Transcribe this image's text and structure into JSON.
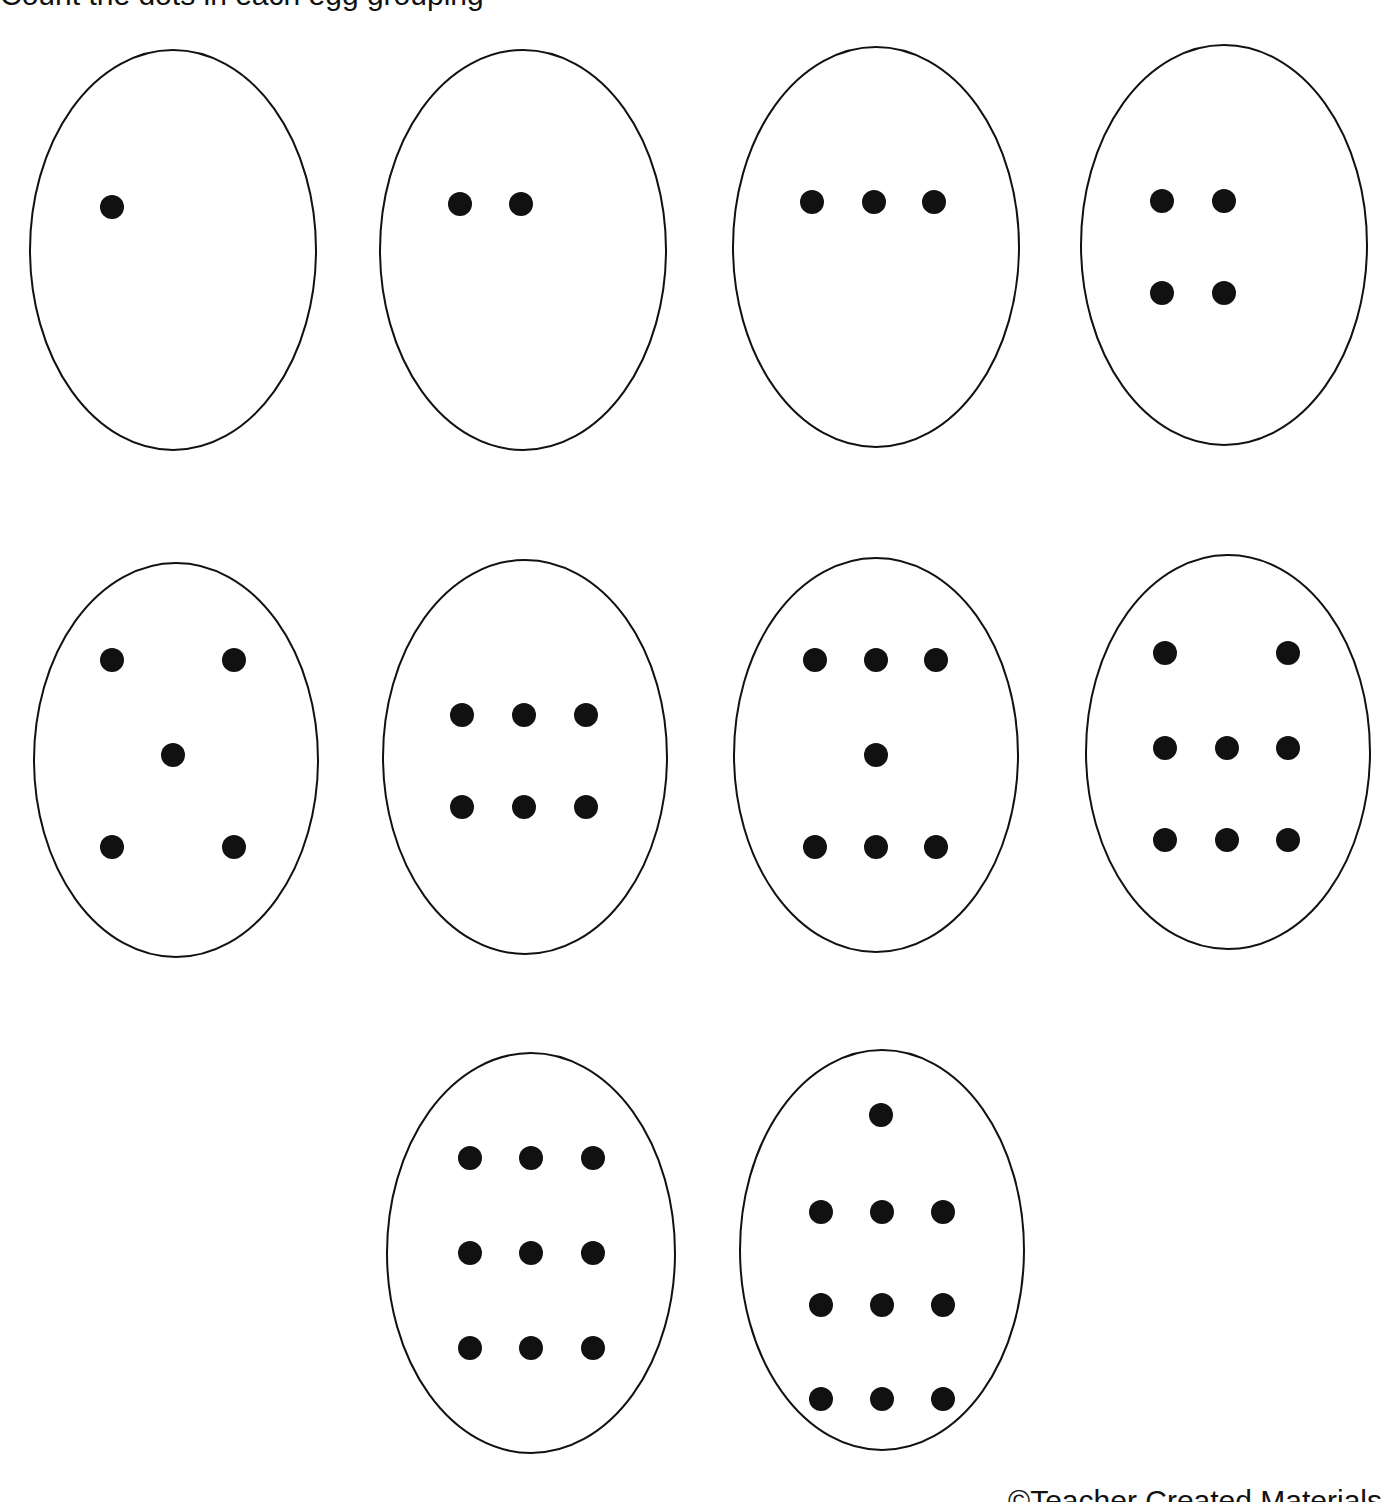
{
  "page": {
    "header_fragment": "Count the dots in each egg grouping",
    "footer_fragment": "©Teacher Created Materials"
  },
  "style": {
    "stroke": "#111111",
    "dot": "#111111",
    "background": "#ffffff"
  },
  "eggs": [
    {
      "count": 1,
      "cx": 173,
      "cy": 250,
      "rx": 143,
      "ry": 200,
      "dots": [
        [
          112,
          207
        ]
      ]
    },
    {
      "count": 2,
      "cx": 523,
      "cy": 250,
      "rx": 143,
      "ry": 200,
      "dots": [
        [
          460,
          204
        ],
        [
          521,
          204
        ]
      ]
    },
    {
      "count": 3,
      "cx": 876,
      "cy": 247,
      "rx": 143,
      "ry": 200,
      "dots": [
        [
          812,
          202
        ],
        [
          874,
          202
        ],
        [
          934,
          202
        ]
      ]
    },
    {
      "count": 4,
      "cx": 1224,
      "cy": 245,
      "rx": 143,
      "ry": 200,
      "dots": [
        [
          1162,
          201
        ],
        [
          1224,
          201
        ],
        [
          1162,
          293
        ],
        [
          1224,
          293
        ]
      ]
    },
    {
      "count": 5,
      "cx": 176,
      "cy": 760,
      "rx": 142,
      "ry": 197,
      "dots": [
        [
          112,
          660
        ],
        [
          234,
          660
        ],
        [
          173,
          755
        ],
        [
          112,
          847
        ],
        [
          234,
          847
        ]
      ]
    },
    {
      "count": 6,
      "cx": 525,
      "cy": 757,
      "rx": 142,
      "ry": 197,
      "dots": [
        [
          462,
          715
        ],
        [
          524,
          715
        ],
        [
          586,
          715
        ],
        [
          462,
          807
        ],
        [
          524,
          807
        ],
        [
          586,
          807
        ]
      ]
    },
    {
      "count": 7,
      "cx": 876,
      "cy": 755,
      "rx": 142,
      "ry": 197,
      "dots": [
        [
          815,
          660
        ],
        [
          876,
          660
        ],
        [
          936,
          660
        ],
        [
          876,
          755
        ],
        [
          815,
          847
        ],
        [
          876,
          847
        ],
        [
          936,
          847
        ]
      ]
    },
    {
      "count": 8,
      "cx": 1228,
      "cy": 752,
      "rx": 142,
      "ry": 197,
      "dots": [
        [
          1165,
          653
        ],
        [
          1288,
          653
        ],
        [
          1165,
          748
        ],
        [
          1227,
          748
        ],
        [
          1288,
          748
        ],
        [
          1165,
          840
        ],
        [
          1227,
          840
        ],
        [
          1288,
          840
        ]
      ]
    },
    {
      "count": 9,
      "cx": 531,
      "cy": 1253,
      "rx": 144,
      "ry": 200,
      "dots": [
        [
          470,
          1158
        ],
        [
          531,
          1158
        ],
        [
          593,
          1158
        ],
        [
          470,
          1253
        ],
        [
          531,
          1253
        ],
        [
          593,
          1253
        ],
        [
          470,
          1348
        ],
        [
          531,
          1348
        ],
        [
          593,
          1348
        ]
      ]
    },
    {
      "count": 10,
      "cx": 882,
      "cy": 1250,
      "rx": 142,
      "ry": 200,
      "dots": [
        [
          881,
          1115
        ],
        [
          821,
          1212
        ],
        [
          882,
          1212
        ],
        [
          943,
          1212
        ],
        [
          821,
          1305
        ],
        [
          882,
          1305
        ],
        [
          943,
          1305
        ],
        [
          821,
          1399
        ],
        [
          882,
          1399
        ],
        [
          943,
          1399
        ]
      ]
    }
  ]
}
